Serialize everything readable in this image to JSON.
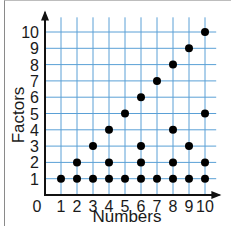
{
  "chart_data": {
    "type": "scatter",
    "title": "",
    "xlabel": "Numbers",
    "ylabel": "Factors",
    "x_ticks": [
      "0",
      "1",
      "2",
      "3",
      "4",
      "5",
      "6",
      "7",
      "8",
      "9",
      "10"
    ],
    "y_ticks": [
      "1",
      "2",
      "3",
      "4",
      "5",
      "6",
      "7",
      "8",
      "9",
      "10"
    ],
    "xlim": [
      0,
      10
    ],
    "ylim": [
      0,
      10
    ],
    "grid": true,
    "grid_color": "#5aa0d6",
    "point_color": "#000000",
    "points": [
      {
        "x": 1,
        "y": 1
      },
      {
        "x": 2,
        "y": 1
      },
      {
        "x": 2,
        "y": 2
      },
      {
        "x": 3,
        "y": 1
      },
      {
        "x": 3,
        "y": 3
      },
      {
        "x": 4,
        "y": 1
      },
      {
        "x": 4,
        "y": 2
      },
      {
        "x": 4,
        "y": 4
      },
      {
        "x": 5,
        "y": 1
      },
      {
        "x": 5,
        "y": 5
      },
      {
        "x": 6,
        "y": 1
      },
      {
        "x": 6,
        "y": 2
      },
      {
        "x": 6,
        "y": 3
      },
      {
        "x": 6,
        "y": 6
      },
      {
        "x": 7,
        "y": 1
      },
      {
        "x": 7,
        "y": 7
      },
      {
        "x": 8,
        "y": 1
      },
      {
        "x": 8,
        "y": 2
      },
      {
        "x": 8,
        "y": 4
      },
      {
        "x": 8,
        "y": 8
      },
      {
        "x": 9,
        "y": 1
      },
      {
        "x": 9,
        "y": 3
      },
      {
        "x": 9,
        "y": 9
      },
      {
        "x": 10,
        "y": 1
      },
      {
        "x": 10,
        "y": 2
      },
      {
        "x": 10,
        "y": 5
      },
      {
        "x": 10,
        "y": 10
      }
    ]
  }
}
